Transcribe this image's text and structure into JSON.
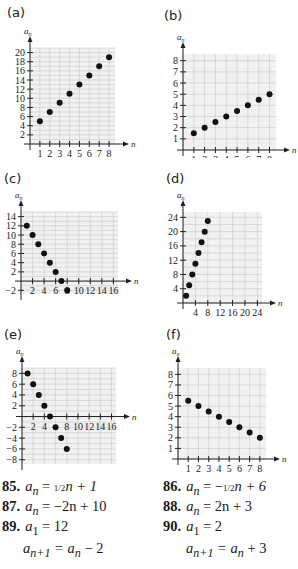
{
  "chart_data": [
    {
      "id": "a",
      "label": "(a)",
      "type": "scatter",
      "xlabel": "n",
      "ylabel": "a_n",
      "x": [
        1,
        2,
        3,
        4,
        5,
        6,
        7,
        8
      ],
      "y": [
        5,
        7,
        9,
        11,
        13,
        15,
        17,
        19
      ],
      "xlim": [
        0,
        8.6
      ],
      "ylim": [
        0,
        21
      ],
      "xticks": [
        1,
        2,
        3,
        4,
        5,
        6,
        7,
        8
      ],
      "yticks": [
        2,
        4,
        6,
        8,
        10,
        12,
        14,
        16,
        18,
        20
      ],
      "xgrid_step": 1,
      "ygrid_step": 1,
      "grid": true
    },
    {
      "id": "b",
      "label": "(b)",
      "type": "scatter",
      "xlabel": "n",
      "ylabel": "a_n",
      "x": [
        1,
        2,
        3,
        4,
        5,
        6,
        7,
        8
      ],
      "y": [
        1.5,
        2,
        2.5,
        3,
        3.5,
        4,
        4.5,
        5
      ],
      "xlim": [
        0,
        8.6
      ],
      "ylim": [
        0,
        8.6
      ],
      "xticks": [
        1,
        2,
        3,
        4,
        5,
        6,
        7,
        8
      ],
      "yticks": [
        1,
        2,
        3,
        4,
        5,
        6,
        7,
        8
      ],
      "xgrid_step": 1,
      "ygrid_step": 1,
      "grid": true
    },
    {
      "id": "c",
      "label": "(c)",
      "type": "scatter",
      "xlabel": "n",
      "ylabel": "a_n",
      "x": [
        1,
        2,
        3,
        4,
        5,
        6,
        7,
        8
      ],
      "y": [
        12,
        10,
        8,
        6,
        4,
        2,
        0,
        -2
      ],
      "xlim": [
        0,
        16.8
      ],
      "ylim": [
        -2.8,
        15
      ],
      "xticks": [
        2,
        4,
        6,
        8,
        10,
        12,
        14,
        16
      ],
      "yticks": [
        -2,
        2,
        4,
        6,
        8,
        10,
        12,
        14
      ],
      "xgrid_step": 2,
      "ygrid_step": 1,
      "grid": true
    },
    {
      "id": "d",
      "label": "(d)",
      "type": "scatter",
      "xlabel": "n",
      "ylabel": "a_n",
      "x": [
        1,
        2,
        3,
        4,
        5,
        6,
        7,
        8
      ],
      "y": [
        2,
        5,
        8,
        11,
        14,
        17,
        20,
        23
      ],
      "xlim": [
        0,
        25.5
      ],
      "ylim": [
        0,
        25.5
      ],
      "xticks": [
        4,
        8,
        12,
        16,
        20,
        24
      ],
      "yticks": [
        4,
        8,
        12,
        16,
        20,
        24
      ],
      "xgrid_step": 4,
      "ygrid_step": 2,
      "grid": true
    },
    {
      "id": "e",
      "label": "(e)",
      "type": "scatter",
      "xlabel": "n",
      "ylabel": "a_n",
      "x": [
        1,
        2,
        3,
        4,
        5,
        6,
        7,
        8
      ],
      "y": [
        8,
        6,
        4,
        2,
        0,
        -2,
        -4,
        -6
      ],
      "xlim": [
        0,
        16.8
      ],
      "ylim": [
        -8.8,
        9
      ],
      "xticks": [
        2,
        4,
        8,
        10,
        12,
        14,
        16
      ],
      "yticks": [
        -8,
        -6,
        -4,
        -2,
        2,
        4,
        6,
        8
      ],
      "xgrid_step": 2,
      "ygrid_step": 1,
      "grid": true
    },
    {
      "id": "f",
      "label": "(f)",
      "type": "scatter",
      "xlabel": "n",
      "ylabel": "a_n",
      "x": [
        1,
        2,
        3,
        4,
        5,
        6,
        7,
        8
      ],
      "y": [
        5.5,
        5,
        4.5,
        4,
        3.5,
        3,
        2.5,
        2
      ],
      "xlim": [
        0,
        8.6
      ],
      "ylim": [
        0,
        8.6
      ],
      "xticks": [
        1,
        2,
        3,
        4,
        5,
        6,
        7,
        8
      ],
      "yticks": [
        1,
        2,
        3,
        4,
        5,
        6,
        7,
        8
      ],
      "xgrid_step": 1,
      "ygrid_step": 1,
      "grid": true
    }
  ],
  "panels": {
    "a": {
      "label": "(a)"
    },
    "b": {
      "label": "(b)"
    },
    "c": {
      "label": "(c)"
    },
    "d": {
      "label": "(d)"
    },
    "e": {
      "label": "(e)"
    },
    "f": {
      "label": "(f)"
    }
  },
  "exercises": [
    {
      "number": "85.",
      "lines": [
        "a_n = (1/2)n + 1"
      ]
    },
    {
      "number": "86.",
      "lines": [
        "a_n = −(1/2)n + 6"
      ]
    },
    {
      "number": "87.",
      "lines": [
        "a_n = −2n + 10"
      ]
    },
    {
      "number": "88.",
      "lines": [
        "a_n = 2n + 3"
      ]
    },
    {
      "number": "89.",
      "lines": [
        "a_1 = 12",
        "a_{n+1} = a_n − 2"
      ]
    },
    {
      "number": "90.",
      "lines": [
        "a_1 = 2",
        "a_{n+1} = a_n + 3"
      ]
    }
  ],
  "text": {
    "ex85_num": "85.",
    "ex85_rhs_pre": "= ",
    "ex85_half": "1/2",
    "ex85_rhs_post": "n + 1",
    "ex86_num": "86.",
    "ex86_rhs_pre": "= −",
    "ex86_half": "1/2",
    "ex86_rhs_post": "n + 6",
    "ex87_num": "87.",
    "ex87_rhs": "= −2n + 10",
    "ex88_num": "88.",
    "ex88_rhs": "= 2n + 3",
    "ex89_num": "89.",
    "ex89_l1": "= 12",
    "ex89_l2": "= a",
    "ex89_l2_tail": " − 2",
    "ex90_num": "90.",
    "ex90_l1": "= 2",
    "ex90_l2": "= a",
    "ex90_l2_tail": " + 3",
    "var_a": "a",
    "sub_n": "n",
    "sub_1": "1",
    "sub_np1": "n+1"
  },
  "colors": {
    "grid": "#c9c9c9",
    "grid_bg": "#f1f1f1",
    "axis": "#222222",
    "dot": "#111111"
  }
}
